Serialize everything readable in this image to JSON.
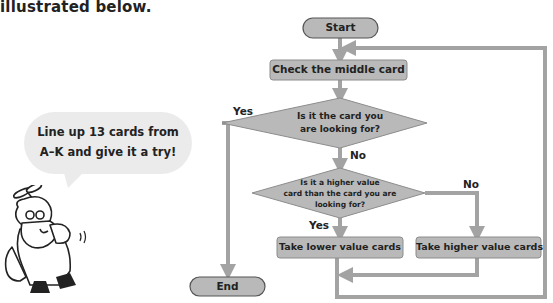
{
  "intro_text": "illustrated below.",
  "speech_bubble": {
    "line1": "Line up 13 cards from",
    "line2": "A–K and give it a try!"
  },
  "flowchart": {
    "start": "Start",
    "step_check": "Check the middle card",
    "decision1": {
      "line1": "Is it the card you",
      "line2": "are looking for?",
      "yes_label": "Yes",
      "no_label": "No"
    },
    "decision2": {
      "line1": "Is it a higher value",
      "line2": "card than the card you are",
      "line3": "looking for?",
      "yes_label": "Yes",
      "no_label": "No"
    },
    "step_lower": "Take lower value cards",
    "step_higher": "Take higher value cards",
    "end": "End"
  },
  "colors": {
    "node_fill": "#b9b9b9",
    "node_border": "#8c8c8c",
    "connector": "#a3a3a3",
    "bubble": "#ebebeb"
  }
}
